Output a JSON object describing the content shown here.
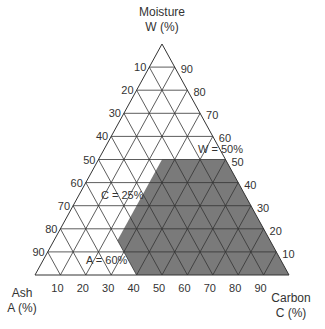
{
  "diagram": {
    "type": "ternary",
    "axes": {
      "top": {
        "name": "Moisture",
        "unit": "W (%)"
      },
      "left": {
        "name": "Ash",
        "unit": "A (%)"
      },
      "right": {
        "name": "Carbon",
        "unit": "C (%)"
      }
    },
    "ticks": {
      "left": [
        "10",
        "20",
        "30",
        "40",
        "50",
        "60",
        "70",
        "80",
        "90"
      ],
      "right": [
        "90",
        "80",
        "70",
        "60",
        "50",
        "40",
        "30",
        "20",
        "10"
      ],
      "bottom": [
        "10",
        "20",
        "30",
        "40",
        "50",
        "60",
        "70",
        "80",
        "90"
      ]
    },
    "annotations": {
      "w": "W = 50%",
      "c": "C = 25%",
      "a": "A = 60%"
    },
    "region": {
      "description": "Shaded region: W ≤ 50%, C ≥ 25%, A ≤ 60%",
      "fill": "#7a7a7a",
      "vertices_WCA": [
        [
          50,
          25,
          25
        ],
        [
          50,
          50,
          0
        ],
        [
          0,
          100,
          0
        ],
        [
          0,
          40,
          60
        ],
        [
          15,
          25,
          60
        ]
      ]
    },
    "colors": {
      "line": "#333333",
      "shade": "#7a7a7a",
      "background": "#ffffff"
    }
  }
}
